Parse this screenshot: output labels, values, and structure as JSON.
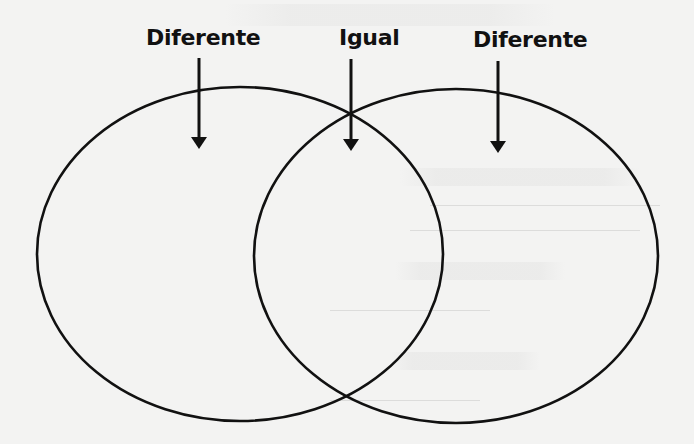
{
  "diagram": {
    "type": "venn",
    "labels": {
      "left": "Diferente",
      "center": "Igual",
      "right": "Diferente"
    },
    "colors": {
      "stroke": "#111111",
      "background": "#f3f3f2",
      "text": "#111111"
    },
    "circles": [
      {
        "name": "left",
        "cx": 240,
        "cy": 254,
        "rx": 203,
        "ry": 167
      },
      {
        "name": "right",
        "cx": 456,
        "cy": 256,
        "rx": 202,
        "ry": 167
      }
    ],
    "arrows": [
      {
        "target": "left-only",
        "x": 199,
        "y1": 58,
        "y2": 148
      },
      {
        "target": "overlap",
        "x": 351,
        "y1": 59,
        "y2": 150
      },
      {
        "target": "right-only",
        "x": 498,
        "y1": 61,
        "y2": 152
      }
    ]
  }
}
